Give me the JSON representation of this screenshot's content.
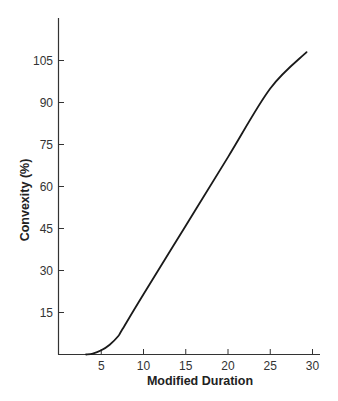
{
  "chart_data": {
    "type": "line",
    "title": "",
    "xlabel": "Modified Duration",
    "ylabel": "Convexity (%)",
    "xlim": [
      0,
      30
    ],
    "ylim": [
      0,
      117
    ],
    "x_ticks": [
      5,
      10,
      15,
      20,
      25,
      30
    ],
    "y_ticks": [
      15,
      30,
      45,
      60,
      75,
      90,
      105
    ],
    "grid": false,
    "legend": null,
    "series": [
      {
        "name": "Convexity",
        "x": [
          3.2,
          4,
          5,
          6,
          7,
          7.5,
          10,
          15,
          20,
          25,
          29.3
        ],
        "y": [
          0,
          0.3,
          1.5,
          3.5,
          6.5,
          9,
          21.5,
          46,
          70.5,
          95,
          108
        ]
      }
    ]
  }
}
